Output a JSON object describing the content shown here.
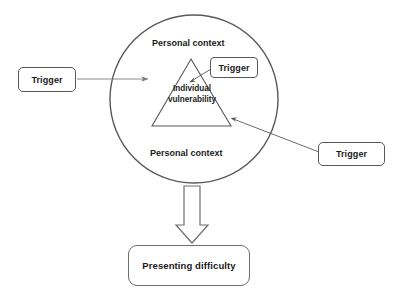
{
  "diagram": {
    "background_color": "#ffffff",
    "stroke_color": "#6d6e71",
    "text_color": "#1a1a1a",
    "circle": {
      "label_top": "Personal context",
      "label_bottom": "Personal context",
      "center_x": 194,
      "center_y": 99,
      "radius": 84
    },
    "triangle": {
      "label_line1": "Individual",
      "label_line2": "vulnerability",
      "apex_x": 191,
      "apex_y": 59,
      "base_left_x": 152,
      "base_right_x": 231,
      "base_y": 126
    },
    "triggers": [
      {
        "id": "trigger-left",
        "label": "Trigger"
      },
      {
        "id": "trigger-top",
        "label": "Trigger"
      },
      {
        "id": "trigger-right",
        "label": "Trigger"
      }
    ],
    "outcome": {
      "label": "Presenting difficulty"
    },
    "connectors": [
      {
        "id": "arrow-left-to-triangle",
        "from": "trigger-left",
        "to": "triangle",
        "style": "thin-line-arrow"
      },
      {
        "id": "arrow-top-to-triangle",
        "from": "trigger-top",
        "to": "triangle",
        "style": "thin-line-arrow"
      },
      {
        "id": "arrow-right-to-triangle",
        "from": "trigger-right",
        "to": "triangle",
        "style": "thin-line-arrow"
      },
      {
        "id": "block-arrow-to-outcome",
        "from": "circle",
        "to": "outcome",
        "style": "hollow-block-arrow"
      }
    ]
  }
}
